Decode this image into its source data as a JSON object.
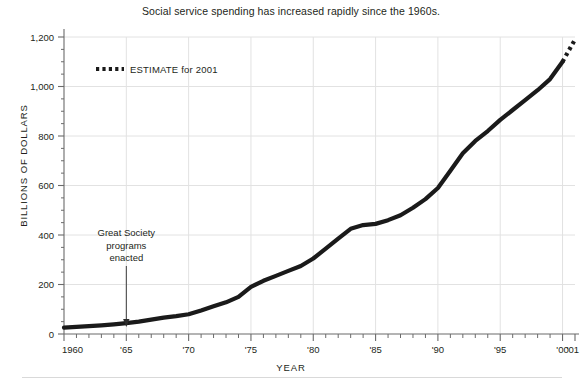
{
  "figure": {
    "title": "Social service spending has increased rapidly since the 1960s.",
    "y_axis_title": "BILLIONS OF DOLLARS",
    "x_axis_title": "YEAR",
    "line_color": "#1a1a1a",
    "grid_color": "#e2e2e2",
    "axis_color": "#6b6b6b"
  },
  "legend": {
    "estimate_label": "ESTIMATE for 2001"
  },
  "annotation": {
    "line1": "Great Society",
    "line2": "programs",
    "line3": "enacted",
    "target_year": 1965
  },
  "chart_data": {
    "type": "line",
    "title": "Social service spending has increased rapidly since the 1960s.",
    "xlabel": "YEAR",
    "ylabel": "BILLIONS OF DOLLARS",
    "xlim": [
      1960,
      2001
    ],
    "ylim": [
      0,
      1200
    ],
    "grid": true,
    "legend_position": "upper-left-inside",
    "y_ticks": [
      0,
      200,
      400,
      600,
      800,
      1000,
      1200
    ],
    "y_tick_labels": [
      "0",
      "200",
      "400",
      "600",
      "800",
      "1,000",
      "1,200"
    ],
    "x_ticks": [
      1960,
      1965,
      1970,
      1975,
      1980,
      1985,
      1990,
      1995,
      2000,
      2001
    ],
    "x_tick_labels": [
      "1960",
      "'65",
      "'70",
      "'75",
      "'80",
      "'85",
      "'90",
      "'95",
      "'00",
      "'01"
    ],
    "x_minor_tick_interval": 1,
    "y_minor_tick_interval": 50,
    "series": [
      {
        "name": "Social service spending",
        "style": "solid",
        "x": [
          1960,
          1961,
          1962,
          1963,
          1964,
          1965,
          1966,
          1967,
          1968,
          1969,
          1970,
          1971,
          1972,
          1973,
          1974,
          1975,
          1976,
          1977,
          1978,
          1979,
          1980,
          1981,
          1982,
          1983,
          1984,
          1985,
          1986,
          1987,
          1988,
          1989,
          1990,
          1991,
          1992,
          1993,
          1994,
          1995,
          1996,
          1997,
          1998,
          1999,
          2000
        ],
        "values": [
          26,
          29,
          32,
          35,
          39,
          44,
          50,
          58,
          66,
          72,
          80,
          95,
          112,
          128,
          150,
          190,
          215,
          235,
          255,
          275,
          305,
          345,
          385,
          425,
          440,
          445,
          460,
          480,
          510,
          545,
          590,
          660,
          730,
          780,
          820,
          865,
          905,
          945,
          985,
          1030,
          1100
        ]
      },
      {
        "name": "ESTIMATE for 2001",
        "style": "dotted",
        "x": [
          2000,
          2001
        ],
        "values": [
          1100,
          1190
        ]
      }
    ],
    "annotations": [
      {
        "text": "Great Society programs enacted",
        "x": 1965,
        "y": 45,
        "arrow": "down"
      }
    ]
  }
}
